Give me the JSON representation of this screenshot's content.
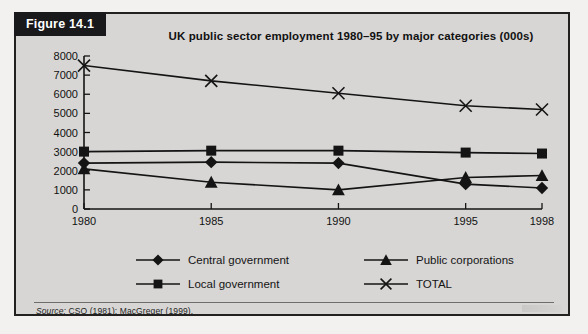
{
  "figure": {
    "tab_label": "Figure 14.1",
    "title": "UK public sector employment 1980–95 by major categories (000s)",
    "source_prefix": "Source:",
    "source_text": " CSO (1981); MacGreger (1999)."
  },
  "colors": {
    "panel_border": "#22211f",
    "panel_background": "#d7d6d4",
    "page_background": "#f2f1ef",
    "tab_background": "#19181a",
    "tab_text": "#ffffff",
    "series_line": "#141414",
    "axis": "#141414",
    "text": "#111111"
  },
  "legend": {
    "entries": [
      {
        "label": "Central government",
        "marker": "diamond-marker",
        "row": 0,
        "col": 0
      },
      {
        "label": "Public corporations",
        "marker": "triangle-marker",
        "row": 0,
        "col": 1
      },
      {
        "label": "Local government",
        "marker": "square-marker",
        "row": 1,
        "col": 0
      },
      {
        "label": "TOTAL",
        "marker": "cross-marker",
        "row": 1,
        "col": 1
      }
    ]
  },
  "chart_data": {
    "type": "line",
    "title": "UK public sector employment 1980–95 by major categories (000s)",
    "xlabel": "",
    "ylabel": "",
    "categories": [
      "1980",
      "1985",
      "1990",
      "1995",
      "1998"
    ],
    "x": [
      1980,
      1985,
      1990,
      1995,
      1998
    ],
    "xlim": [
      1980,
      1998
    ],
    "ylim": [
      0,
      8000
    ],
    "ytick_labels": [
      "0",
      "1000",
      "2000",
      "3000",
      "4000",
      "5000",
      "6000",
      "7000",
      "8000"
    ],
    "yticks": [
      0,
      1000,
      2000,
      3000,
      4000,
      5000,
      6000,
      7000,
      8000
    ],
    "xtick_labels": [
      "1980",
      "1985",
      "1990",
      "1995",
      "1998"
    ],
    "grid": false,
    "legend_position": "bottom",
    "series": [
      {
        "name": "TOTAL",
        "marker": "cross",
        "values": [
          7500,
          6700,
          6050,
          5400,
          5200
        ]
      },
      {
        "name": "Local government",
        "marker": "square",
        "values": [
          3000,
          3050,
          3050,
          2950,
          2900
        ]
      },
      {
        "name": "Central government",
        "marker": "diamond",
        "values": [
          2400,
          2450,
          2400,
          1300,
          1100
        ]
      },
      {
        "name": "Public corporations",
        "marker": "triangle",
        "values": [
          2100,
          1400,
          1000,
          1650,
          1750
        ]
      }
    ]
  }
}
